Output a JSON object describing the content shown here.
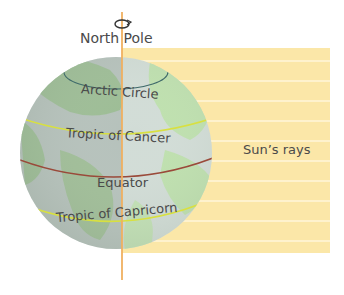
{
  "diagram": {
    "title_label": "North Pole",
    "latitude_labels": {
      "arctic": "Arctic Circle",
      "cancer": "Tropic of Cancer",
      "equator": "Equator",
      "capricorn": "Tropic of Capricorn"
    },
    "rays_label": "Sun’s rays",
    "icons": {
      "rotation": "rotation-arrow-icon"
    },
    "colors": {
      "rays_fill": "#fbe7a8",
      "ray_line": "#fff6da",
      "axis": "#f0b060",
      "tropic_line": "#d8e040",
      "equator_line": "#9a4a3a",
      "arctic_line": "#3f6a6a",
      "globe_land": "#a8d4a0",
      "globe_ocean": "#d8e4e6",
      "text": "#4a4a4a"
    }
  }
}
